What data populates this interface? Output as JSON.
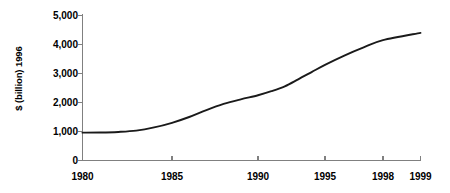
{
  "chart_data": {
    "type": "line",
    "title": "",
    "subtitle": "",
    "xlabel": "",
    "ylabel": "$ (billion) 1996",
    "xlim": [
      1980,
      1999
    ],
    "ylim": [
      0,
      5000
    ],
    "grid": false,
    "legend": null,
    "legend_position": "none",
    "y_ticks": [
      0,
      1000,
      2000,
      3000,
      4000,
      5000
    ],
    "y_tick_labels": [
      "0",
      "1,000",
      "2,000",
      "3,000",
      "4,000",
      "5,000"
    ],
    "x_ticks": [
      1980,
      1985,
      1990,
      1995,
      1998,
      1999
    ],
    "x_tick_labels": [
      "1980",
      "1985",
      "1990",
      "1995",
      "1998",
      "1999"
    ],
    "series": [
      {
        "name": "value",
        "color": "#1a1a1a",
        "x": [
          1980,
          1981,
          1982,
          1983,
          1984,
          1985,
          1986,
          1987,
          1988,
          1989,
          1990,
          1991,
          1992,
          1993,
          1994,
          1995,
          1996,
          1997,
          1998,
          1999
        ],
        "values": [
          960,
          965,
          985,
          1030,
          1140,
          1300,
          1500,
          1740,
          1950,
          2110,
          2250,
          2390,
          2560,
          2800,
          3050,
          3300,
          3620,
          3900,
          4150,
          4400
        ]
      }
    ]
  },
  "axis": {
    "y_title": "$ (billion) 1996"
  },
  "colors": {
    "line": "#1a1a1a",
    "axis": "#808080",
    "text": "#000000",
    "background": "#ffffff"
  }
}
